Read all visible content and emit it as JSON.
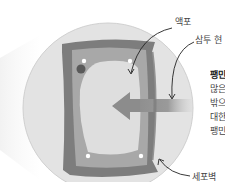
{
  "diagram": {
    "colors": {
      "background": "#ffffff",
      "magnifier_circle": "#e2e2e2",
      "magnifier_edge": "#d4d4d4",
      "cell_wall": "#7d7d7d",
      "cytoplasm": "#a9a9a9",
      "vacuole": "#dedede",
      "arrow": "#8c8c8c",
      "nucleus": "#5a5a5a",
      "dots": "#ffffff",
      "pointer_line": "#222222"
    },
    "labels": {
      "vacuole": "액포",
      "osmosis": "삼투 현",
      "cell_wall": "세포벽"
    },
    "side_text": {
      "heading": "팽민",
      "lines": [
        "많은",
        "밖으",
        "대한",
        "팽민"
      ]
    }
  }
}
